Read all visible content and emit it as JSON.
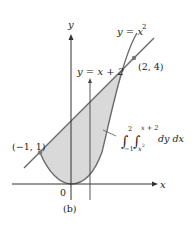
{
  "figure": {
    "caption": "(b)",
    "axes": {
      "x_label": "x",
      "y_label": "y",
      "origin_label": "0"
    },
    "curves": {
      "parabola_label": "y = x",
      "parabola_exp": "2",
      "line_label": "y = x + 2"
    },
    "points": {
      "upper": "(2, 4)",
      "lower": "(−1, 1)"
    },
    "integral": {
      "outer_upper": "2",
      "outer_lower": "−1",
      "inner_upper": "x + 2",
      "inner_lower": "x",
      "inner_lower_exp": "2",
      "differentials": "dy dx"
    },
    "colors": {
      "region_fill": "#d9d9d9",
      "curve_stroke": "#6b6b6b",
      "axis_stroke": "#333333",
      "point_fill": "#777777"
    }
  }
}
